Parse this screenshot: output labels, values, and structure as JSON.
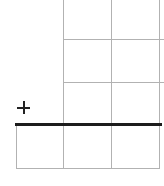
{
  "canvas": {
    "kind": "spreadsheet-grid",
    "visible_text": "",
    "rows_visible": 4,
    "columns_visible": 3,
    "cells_below_thick_border": 3
  },
  "icons": {
    "cursor": "plus-crosshair-cursor"
  },
  "colors": {
    "background": "#ffffff",
    "gridline": "#b2b2b2",
    "border_line": "#1c1c1c",
    "cursor": "#222222"
  }
}
